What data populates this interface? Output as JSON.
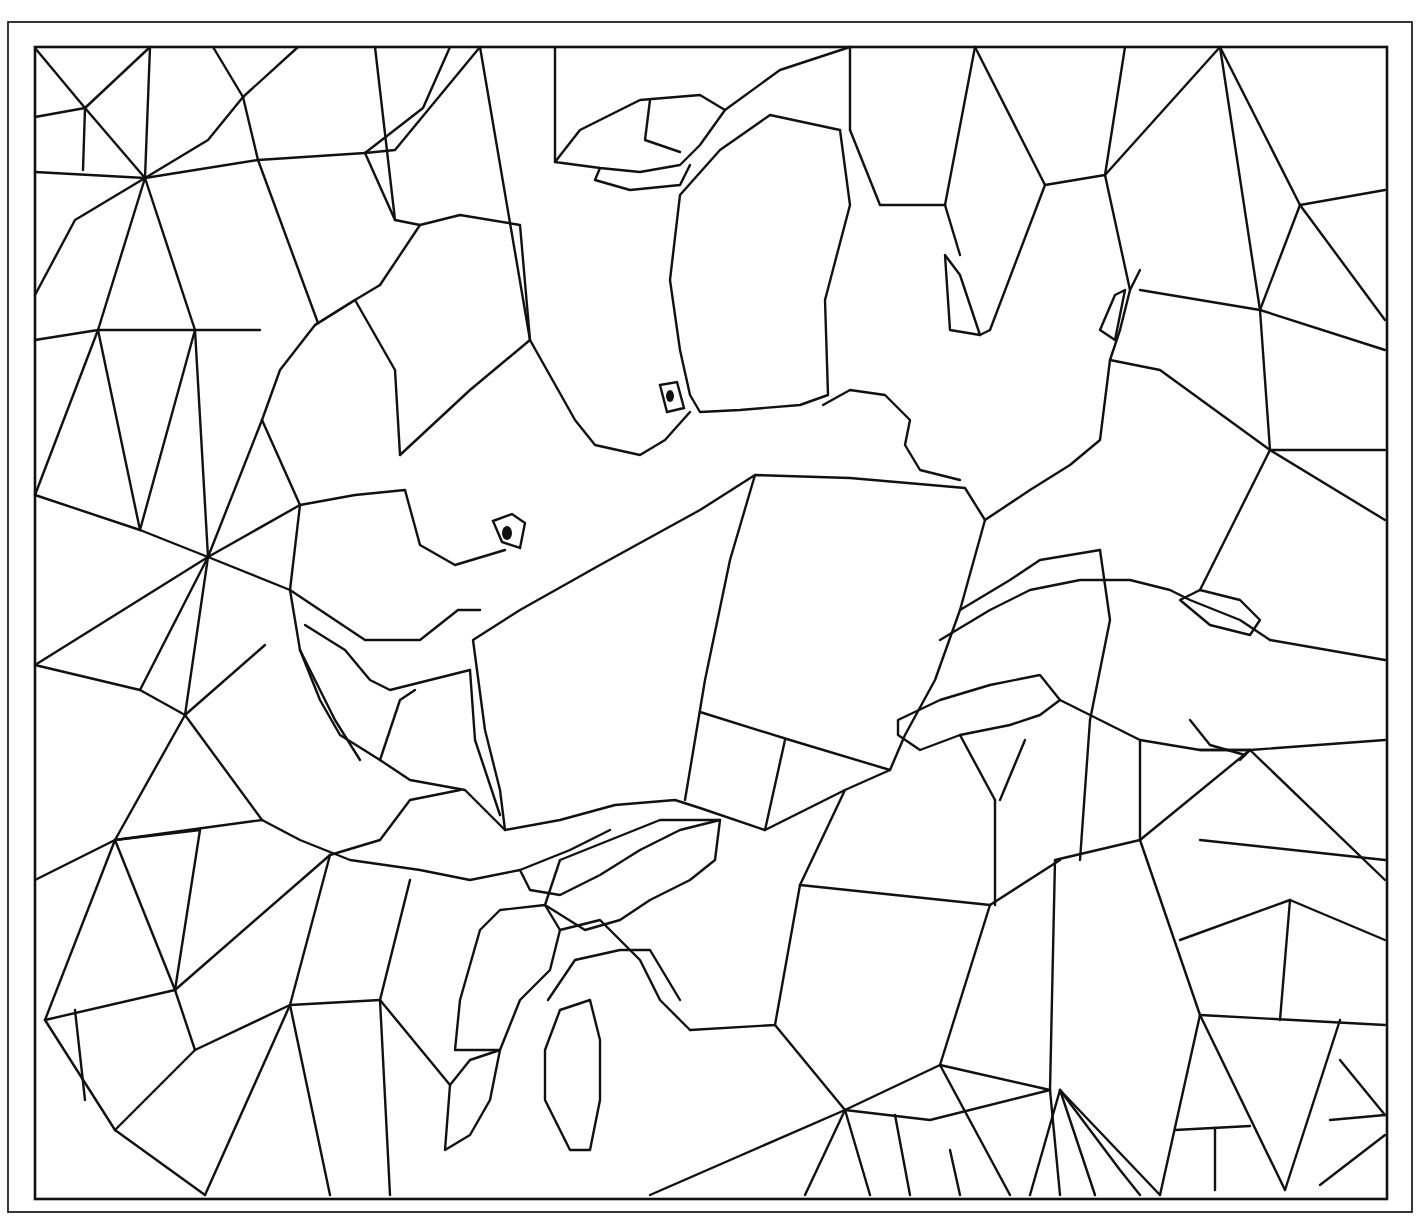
{
  "illustration": {
    "subject": "stained-glass mosaic crab coloring page",
    "stroke_color": "#111111",
    "background_color": "#ffffff",
    "frame_outer": {
      "x": 8,
      "y": 22,
      "w": 1404,
      "h": 1190
    },
    "frame_inner": {
      "x": 35,
      "y": 47,
      "w": 1352,
      "h": 1152
    },
    "eyes": [
      {
        "cx": 507,
        "cy": 533,
        "rx": 5,
        "ry": 7
      },
      {
        "cx": 670,
        "cy": 396,
        "rx": 4,
        "ry": 6
      }
    ],
    "eye_boxes": [
      "M493,521 L512,514 L525,523 L520,548 L502,542 Z",
      "M660,385 L677,382 L684,408 L667,412 Z"
    ],
    "crab_shell": [
      "M473,640 L520,610 L600,565 L700,510 L755,475 L850,478 L965,488 L985,520 L960,610 L935,680 L905,735 L890,770 L845,790 L765,830 L700,808 L675,800 L615,805 L560,820 L505,830 L500,790 L485,730 Z",
      "M755,475 L730,560 L705,680 L685,800",
      "M700,712 L790,740 L890,770",
      "M765,830 L785,740"
    ],
    "crab_claws": [
      "M555,162 L580,130 L640,100 L700,95 L725,110 L700,145 L680,165 L640,172 L600,168 Z",
      "M600,168 L595,180 L630,190 L680,185 L690,165",
      "M650,100 L645,140 L680,152",
      "M680,195 L720,150 L770,115 L840,130 L850,205 L825,300 L828,395 L800,405 L740,410 L700,412 L690,395 L680,350 L670,280 Z",
      "M380,285 L420,225 L460,215 L520,225 L530,340 L575,420 L595,445 L640,455 L665,440 L690,412",
      "M262,420 L280,370 L315,325 L355,300 L380,285",
      "M262,420 L300,505 L355,495 L405,490 L420,545 L455,565 L505,550",
      "M315,325 L355,300 L395,370 L400,455",
      "M400,455 L470,390 L530,340",
      "M823,405 L850,390 L885,395 L910,420 L905,445 L920,470 L960,480",
      "M945,255 L960,275 L980,335 L950,330 Z"
    ],
    "crab_legs": [
      "M300,505 L290,590 L300,650 L320,700 L340,735 L380,760 L410,780 L465,790 L505,830",
      "M290,590 L365,640 L420,640 L458,610 L480,610",
      "M305,625 L345,650 L370,680 L390,690 L430,680 L470,670",
      "M300,650 L335,720 L360,760",
      "M380,760 L400,700 L415,690",
      "M470,670 L475,740 L500,815",
      "M262,820 L300,840 L350,860 L420,870 L470,880 L520,870 L570,850 L610,830",
      "M330,855 L380,840 L410,800 L460,790",
      "M520,870 L530,890 L560,895 L600,875 L640,850 L680,830 L720,820",
      "M480,930 L500,910 L545,905 L560,930 L550,970 L520,1000 L500,1050 L455,1050 L460,1000 Z",
      "M545,905 L560,860 L610,840 L660,820 L720,820 L715,860 L690,880 L650,900 L620,920 L585,930 Z",
      "M560,930 L600,920 L640,960 L660,1000 L690,1030",
      "M548,1000 L575,960 L620,950 L650,950 L680,1000",
      "M545,1050 L560,1010 L590,1000 L600,1040 L600,1100 L590,1150 L570,1150 L545,1100 Z",
      "M450,1085 L470,1060 L500,1050 L490,1100 L470,1135 L445,1150 Z",
      "M898,720 L940,700 L990,685 L1040,675 L1060,700 L1040,715 L1010,725 L960,735 L920,750 L898,735 Z",
      "M940,640 L990,610 L1030,590 L1080,580 L1130,580 L1170,590 L1190,600 L1240,620 L1270,640",
      "M1180,600 L1200,590 L1240,600 L1260,620 L1250,635 L1210,625 Z",
      "M985,520 L1030,490 L1070,465 L1100,440 L1105,400 L1110,360",
      "M1110,360 L1120,330 L1130,290 L1140,270",
      "M1100,330 L1115,295 L1125,290 L1115,340 Z",
      "M960,610 L1010,580 L1040,560 L1100,550",
      "M1060,700 L1100,720 L1140,740 L1200,750 L1250,750 L1240,760",
      "M1190,720 L1210,745 L1245,755"
    ],
    "background_mosaic": [
      "M35,172 L145,178 L258,160 L365,153",
      "M35,48 L85,108 L145,178",
      "M35,117 L85,108 L150,47",
      "M85,108 L83,170",
      "M145,178 L150,47",
      "M145,178 L208,140 L243,97 L298,47",
      "M213,47 L243,97",
      "M258,160 L243,97",
      "M258,160 L318,323",
      "M365,153 L395,220 L420,225",
      "M375,47 L395,220",
      "M365,153 L423,108 L450,47",
      "M35,340 L98,330 L195,330 L260,330",
      "M145,178 L98,330",
      "M145,178 L195,330",
      "M145,178 L75,220 L35,295",
      "M98,330 L35,495",
      "M98,330 L140,530",
      "M195,330 L140,530 L208,557",
      "M195,330 L208,557",
      "M140,530 L35,495",
      "M208,557 L262,420",
      "M208,557 L300,505",
      "M35,665 L208,557",
      "M208,557 L140,690 L35,665",
      "M208,557 L290,590",
      "M208,557 L185,715",
      "M140,690 L185,715 L265,645",
      "M185,715 L115,840",
      "M185,715 L262,820",
      "M35,880 L115,840 L262,820",
      "M115,840 L175,990",
      "M115,840 L45,1020",
      "M115,840 L200,830",
      "M200,830 L175,990",
      "M175,990 L45,1020",
      "M175,990 L330,855",
      "M175,990 L195,1050",
      "M45,1020 L115,1130",
      "M115,1130 L205,1195",
      "M195,1050 L290,1005 L380,1000",
      "M195,1050 L115,1130",
      "M290,1005 L205,1195",
      "M290,1005 L330,1195",
      "M380,1000 L390,1195",
      "M330,855 L290,1005",
      "M380,1000 L410,880",
      "M380,1000 L450,1085",
      "M75,1010 L85,1100",
      "M480,47 L395,150 L365,153",
      "M480,47 L530,340",
      "M555,47 L555,162",
      "M725,110 L780,70 L850,47",
      "M850,47 L850,130",
      "M850,130 L880,205 L945,205",
      "M945,205 L975,47",
      "M945,205 L960,255",
      "M975,47 L1045,185 L1105,175 L1125,47",
      "M1045,185 L990,330 L980,335",
      "M1105,175 L1130,290",
      "M1105,175 L1220,47 L1300,205",
      "M1220,47 L1260,310",
      "M1300,205 L1385,190",
      "M1300,205 L1385,320",
      "M1300,205 L1260,310 L1140,290",
      "M1260,310 L1385,350",
      "M1260,310 L1270,450",
      "M1270,450 L1385,520",
      "M1270,450 L1160,370 L1110,360",
      "M1270,450 L1200,590",
      "M1270,450 L1385,450",
      "M1385,660 L1270,640",
      "M1250,750 L1385,740",
      "M1250,750 L1385,880",
      "M1250,750 L1140,840",
      "M1140,840 L1200,1015",
      "M1200,1015 L1385,1025",
      "M1200,1015 L1160,1195",
      "M1200,1015 L1285,1190",
      "M1285,1190 L1340,1020",
      "M1330,1120 L1385,1115",
      "M1340,1060 L1385,1115",
      "M1320,1185 L1385,1135",
      "M1175,1130 L1250,1126",
      "M1215,1128 L1215,1190",
      "M1140,840 L1055,860 L1050,1090",
      "M1050,1090 L1060,1195",
      "M1050,1090 L940,1065 L845,1110",
      "M845,1110 L805,1195",
      "M845,1110 L870,1195",
      "M845,1110 L650,1195",
      "M845,1110 L775,1025",
      "M940,1065 L1010,1195",
      "M940,1065 L990,905",
      "M990,905 L1060,860",
      "M990,905 L800,885",
      "M800,885 L775,1025 L690,1030",
      "M800,885 L845,790",
      "M1060,1090 L1120,1170 L1140,1195",
      "M1060,1090 L1030,1195",
      "M1060,1090 L1095,1195",
      "M1060,1090 L1160,1195",
      "M845,1110 L930,1120 L1050,1090",
      "M960,1195 L950,1150",
      "M910,1195 L895,1115",
      "M995,800 L995,905",
      "M1000,800 L1025,740",
      "M960,735 L995,800",
      "M1100,550 L1110,620 L1090,720",
      "M1090,720 L1080,860",
      "M1140,740 L1140,840",
      "M1200,750 L1250,750",
      "M1200,840 L1385,860",
      "M1180,940 L1290,900 L1385,940",
      "M1290,900 L1280,1020"
    ]
  }
}
